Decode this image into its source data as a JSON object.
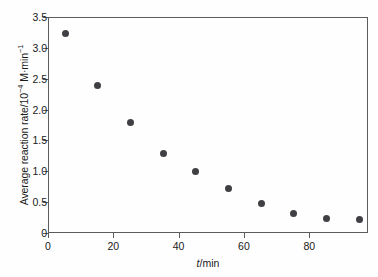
{
  "chart_data": {
    "type": "scatter",
    "title": "",
    "xlabel": "t/min",
    "xlabel_italic_part": "t",
    "xlabel_rest": "/min",
    "ylabel": "Average reaction rate/10−4 M·min−1",
    "ylabel_prefix": "Average reaction rate/10",
    "ylabel_exp1": "−4",
    "ylabel_mid": " M·min",
    "ylabel_exp2": "−1",
    "xlim": [
      0,
      98
    ],
    "ylim": [
      0,
      3.5
    ],
    "grid": false,
    "legend": null,
    "marker": "filled-circle",
    "marker_color": "#3f3f44",
    "axis_color": "#5c5c5c",
    "background_color": "#ffffff",
    "x": [
      5,
      15,
      25,
      35,
      45,
      55,
      65,
      75,
      85,
      95
    ],
    "y": [
      3.25,
      2.41,
      1.8,
      1.31,
      1.02,
      0.73,
      0.5,
      0.33,
      0.25,
      0.23
    ],
    "xticks": [
      0,
      20,
      40,
      60,
      80
    ],
    "xtick_labels": [
      "0",
      "20",
      "40",
      "60",
      "80"
    ],
    "yticks": [
      0,
      0.5,
      1.0,
      1.5,
      2.0,
      2.5,
      3.0,
      3.5
    ],
    "ytick_labels": [
      "0",
      "0.5",
      "1.0",
      "1.5",
      "2.0",
      "2.5",
      "3.0",
      "3.5"
    ]
  }
}
